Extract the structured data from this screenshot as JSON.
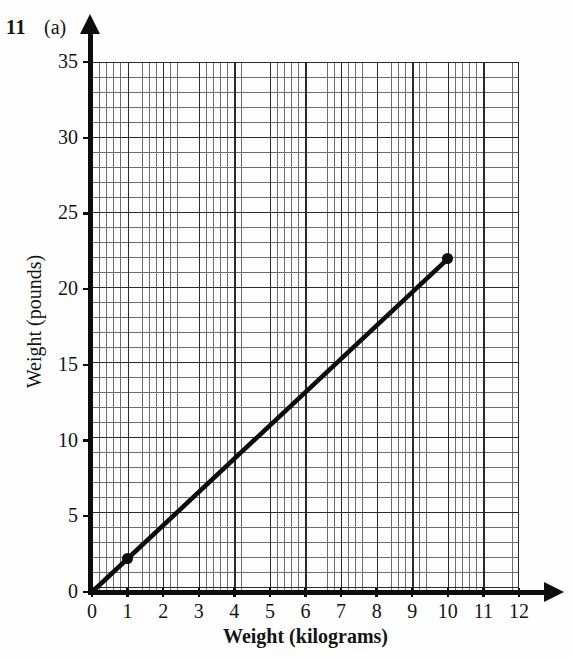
{
  "header": {
    "question_number": "11",
    "part_label": "(a)"
  },
  "chart_data": {
    "type": "line",
    "title": "",
    "xlabel": "Weight (kilograms)",
    "ylabel": "Weight (pounds)",
    "xlim": [
      0,
      12
    ],
    "ylim": [
      0,
      35
    ],
    "xticks": [
      "0",
      "1",
      "2",
      "3",
      "4",
      "5",
      "6",
      "7",
      "8",
      "9",
      "10",
      "11",
      "12"
    ],
    "yticks": [
      "0",
      "5",
      "10",
      "15",
      "20",
      "25",
      "30",
      "35"
    ],
    "xtick_values": [
      0,
      1,
      2,
      3,
      4,
      5,
      6,
      7,
      8,
      9,
      10,
      11,
      12
    ],
    "ytick_values": [
      0,
      5,
      10,
      15,
      20,
      25,
      30,
      35
    ],
    "grid": true,
    "grid_minor": true,
    "grid_minor_x_step": 0.2,
    "grid_minor_y_step": 1,
    "grid_major_x_step": 1,
    "grid_major_y_step": 5,
    "legend": false,
    "line_color": "#0d0d0d",
    "series": [
      {
        "name": "kilograms to pounds conversion",
        "x": [
          0,
          10
        ],
        "y": [
          0,
          22
        ],
        "markers": [
          {
            "x": 1,
            "y": 2.2
          },
          {
            "x": 10,
            "y": 22
          }
        ]
      }
    ],
    "slope_pounds_per_kilogram": 2.2
  }
}
